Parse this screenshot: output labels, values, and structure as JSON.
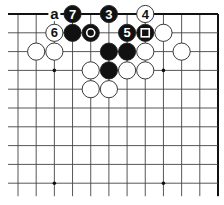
{
  "diagram": {
    "board": {
      "origin_x": 18,
      "origin_y": 14,
      "spacing_x": 18.18,
      "spacing_y": 18.8,
      "cols": 12,
      "rows": 10,
      "line_extend_left": 10,
      "line_extend_bottom": 13,
      "top_edge": true,
      "right_edge": true,
      "line_color": "#444444",
      "edge_color": "#111111",
      "star_points": [
        [
          2,
          3
        ],
        [
          8,
          3
        ],
        [
          2,
          9
        ],
        [
          8,
          9
        ]
      ]
    },
    "stones": [
      {
        "col": 3,
        "row": 0,
        "color": "black",
        "label": "7"
      },
      {
        "col": 5,
        "row": 0,
        "color": "black",
        "label": "3"
      },
      {
        "col": 7,
        "row": 0,
        "color": "white",
        "label": "4"
      },
      {
        "col": 2,
        "row": 1,
        "color": "white",
        "label": "6"
      },
      {
        "col": 3,
        "row": 1,
        "color": "black",
        "label": ""
      },
      {
        "col": 4,
        "row": 1,
        "color": "black",
        "mark": "circle"
      },
      {
        "col": 6,
        "row": 1,
        "color": "black",
        "label": "5"
      },
      {
        "col": 7,
        "row": 1,
        "color": "black",
        "mark": "square"
      },
      {
        "col": 8,
        "row": 1,
        "color": "white",
        "label": ""
      },
      {
        "col": 1,
        "row": 2,
        "color": "white",
        "label": ""
      },
      {
        "col": 2,
        "row": 2,
        "color": "white",
        "label": ""
      },
      {
        "col": 5,
        "row": 2,
        "color": "black",
        "label": ""
      },
      {
        "col": 6,
        "row": 2,
        "color": "black",
        "label": ""
      },
      {
        "col": 7,
        "row": 2,
        "color": "white",
        "label": ""
      },
      {
        "col": 9,
        "row": 2,
        "color": "white",
        "label": ""
      },
      {
        "col": 4,
        "row": 3,
        "color": "white",
        "label": ""
      },
      {
        "col": 5,
        "row": 3,
        "color": "black",
        "label": ""
      },
      {
        "col": 6,
        "row": 3,
        "color": "white",
        "label": ""
      },
      {
        "col": 7,
        "row": 3,
        "color": "white",
        "label": ""
      },
      {
        "col": 4,
        "row": 4,
        "color": "white",
        "label": ""
      },
      {
        "col": 5,
        "row": 4,
        "color": "white",
        "label": ""
      }
    ],
    "point_labels": [
      {
        "col": 2,
        "row": 0,
        "text": "a"
      }
    ]
  }
}
